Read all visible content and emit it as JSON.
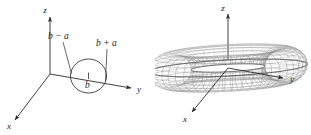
{
  "figure": {
    "background_color": "#ffffff",
    "ink_color": "#2b2b2b",
    "mesh_color": "#8d8d8d",
    "panels": [
      {
        "id": "generating-circle",
        "axes": {
          "x_label": "x",
          "y_label": "y",
          "z_label": "z"
        },
        "labels": {
          "inner_radius": "b − a",
          "outer_radius": "b + a",
          "center_distance": "b"
        }
      },
      {
        "id": "torus-surface",
        "axes": {
          "x_label": "x",
          "y_label": "y",
          "z_label": "z"
        },
        "labels": {}
      }
    ]
  },
  "chart_data": {
    "type": "diagram",
    "title": "",
    "subtitle": "",
    "panels": [
      {
        "name": "generating-circle",
        "type": "scatter",
        "xlabel": "y",
        "ylabel": "z",
        "annotations": [
          "b − a",
          "b + a",
          "b"
        ],
        "parameters": {
          "center_distance_b": "b",
          "circle_radius_a": "a",
          "inner_edge": "b − a",
          "outer_edge": "b + a"
        },
        "axis_labels": [
          "x",
          "y",
          "z"
        ],
        "grid": false,
        "legend": "none"
      },
      {
        "name": "torus-surface",
        "type": "surface",
        "xlabel": "x",
        "ylabel": "y",
        "zlabel": "z",
        "mesh_u_lines": 48,
        "mesh_v_lines": 24,
        "axis_labels": [
          "x",
          "y",
          "z"
        ],
        "grid": false,
        "legend": "none"
      }
    ]
  }
}
